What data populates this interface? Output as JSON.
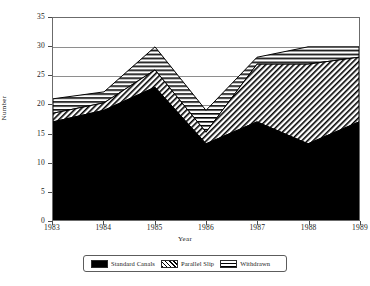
{
  "chart_data": {
    "type": "area",
    "stacked": true,
    "title": "",
    "xlabel": "Year",
    "ylabel": "Number",
    "categories": [
      "1983",
      "1984",
      "1985",
      "1986",
      "1987",
      "1988",
      "1989"
    ],
    "x": [
      1983,
      1984,
      1985,
      1986,
      1987,
      1988,
      1989
    ],
    "xlim": [
      1983,
      1989
    ],
    "ylim": [
      0,
      35
    ],
    "yticks": [
      0,
      5,
      10,
      15,
      20,
      25,
      30,
      35
    ],
    "grid": true,
    "legend_position": "bottom",
    "series": [
      {
        "name": "Standard Canals",
        "fill": "solid-black",
        "color": "#000000",
        "values": [
          17,
          19,
          23,
          13.2,
          17,
          13.2,
          17
        ]
      },
      {
        "name": "Parallel Slip",
        "fill": "diagonal-hatch",
        "color": "#000000",
        "values": [
          1.5,
          1.3,
          3,
          2,
          10,
          13.8,
          11.2
        ],
        "cumulative_tops": [
          18.5,
          20.3,
          26,
          15.2,
          27,
          27,
          28.2
        ]
      },
      {
        "name": "Withdrawn",
        "fill": "horizontal-hatch",
        "color": "#000000",
        "values": [
          2.5,
          1.9,
          4,
          3.8,
          1.2,
          3,
          1.8
        ],
        "cumulative_tops": [
          21,
          22.2,
          30,
          19,
          28.2,
          30,
          30
        ]
      }
    ],
    "totals": [
      21,
      22.2,
      30,
      19,
      28.2,
      30,
      30
    ]
  },
  "axes": {
    "y_tick_labels": [
      "0",
      "5",
      "10",
      "15",
      "20",
      "25",
      "30",
      "35"
    ],
    "x_tick_labels": [
      "1983",
      "1984",
      "1985",
      "1986",
      "1987",
      "1988",
      "1989"
    ],
    "y_axis_title": "Number",
    "x_axis_title": "Year"
  },
  "legend": {
    "entries": [
      {
        "label": "Standard Canals",
        "swatch": "solid-black-swatch"
      },
      {
        "label": "Parallel Slip",
        "swatch": "diagonal-hatch-swatch"
      },
      {
        "label": "Withdrawn",
        "swatch": "horizontal-hatch-swatch"
      }
    ]
  }
}
